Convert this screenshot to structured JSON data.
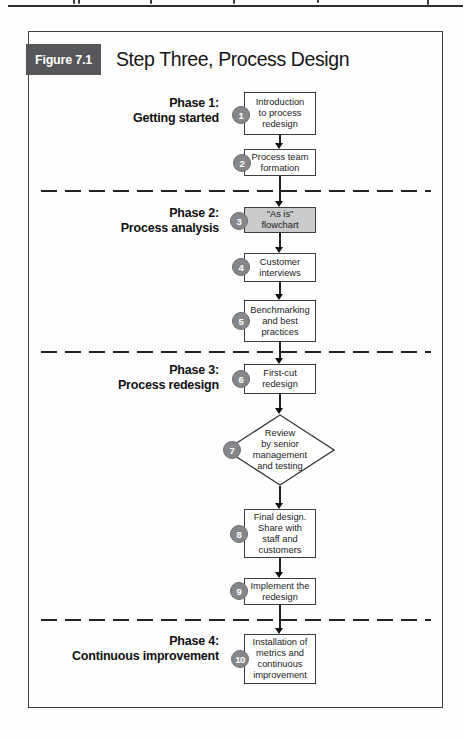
{
  "figure": {
    "label": "Figure 7.1",
    "title": "Step Three, Process Design"
  },
  "phases": [
    {
      "name": "Phase 1:",
      "subtitle": "Getting started"
    },
    {
      "name": "Phase 2:",
      "subtitle": "Process analysis"
    },
    {
      "name": "Phase 3:",
      "subtitle": "Process redesign"
    },
    {
      "name": "Phase 4:",
      "subtitle": "Continuous improvement"
    }
  ],
  "steps": [
    {
      "num": "1",
      "shape": "rect",
      "lines": [
        "Introduction",
        "to process",
        "redesign"
      ]
    },
    {
      "num": "2",
      "shape": "rect",
      "lines": [
        "Process team",
        "formation"
      ]
    },
    {
      "num": "3",
      "shape": "rect",
      "shaded": true,
      "lines": [
        "\"As is\"",
        "flowchart"
      ]
    },
    {
      "num": "4",
      "shape": "rect",
      "lines": [
        "Customer",
        "interviews"
      ]
    },
    {
      "num": "5",
      "shape": "rect",
      "lines": [
        "Benchmarking",
        "and best",
        "practices"
      ]
    },
    {
      "num": "6",
      "shape": "rect",
      "lines": [
        "First-cut",
        "redesign"
      ]
    },
    {
      "num": "7",
      "shape": "diamond",
      "lines": [
        "Review",
        "by senior",
        "management",
        "and testing"
      ]
    },
    {
      "num": "8",
      "shape": "rect",
      "lines": [
        "Final design.",
        "Share with",
        "staff and",
        "customers"
      ]
    },
    {
      "num": "9",
      "shape": "rect",
      "lines": [
        "Implement the",
        "redesign"
      ]
    },
    {
      "num": "10",
      "shape": "rect",
      "lines": [
        "Installation of",
        "metrics and",
        "continuous",
        "improvement"
      ]
    }
  ],
  "colors": {
    "badge_background": "#56575b",
    "badge_text": "#ffffff",
    "step_circle": "#85878b",
    "shaded_box": "#c9cacb",
    "line_and_border": "#3c3c3c",
    "dashed_divider": "#232323",
    "paper": "#fefefe"
  }
}
